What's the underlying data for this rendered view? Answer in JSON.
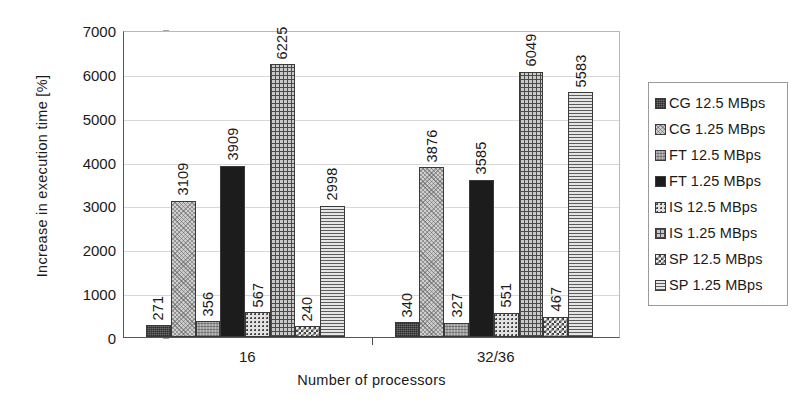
{
  "chart_data": {
    "type": "bar",
    "title": "",
    "subtitle": "",
    "xlabel": "Number of processors",
    "ylabel": "Increase in execution time [%]",
    "categories": [
      "16",
      "32/36"
    ],
    "ylim": [
      0,
      7000
    ],
    "yticks": [
      0,
      1000,
      2000,
      3000,
      4000,
      5000,
      6000,
      7000
    ],
    "ytick_labels": [
      "0",
      "1000",
      "2000",
      "3000",
      "4000",
      "5000",
      "6000",
      "7000"
    ],
    "grid": true,
    "legend_position": "right",
    "series": [
      {
        "name": "CG 12.5 MBps",
        "pattern": "dark-grey-noise",
        "values": [
          271,
          340
        ]
      },
      {
        "name": "CG 1.25 MBps",
        "pattern": "light-stipple",
        "values": [
          3109,
          3876
        ]
      },
      {
        "name": "FT 12.5 MBps",
        "pattern": "mid-grey-texture",
        "values": [
          356,
          327
        ]
      },
      {
        "name": "FT 1.25 MBps",
        "pattern": "solid-black",
        "values": [
          3909,
          3585
        ]
      },
      {
        "name": "IS 12.5 MBps",
        "pattern": "dotted",
        "values": [
          567,
          551
        ]
      },
      {
        "name": "IS 1.25 MBps",
        "pattern": "cross-hatch",
        "values": [
          6225,
          6049
        ]
      },
      {
        "name": "SP 12.5 MBps",
        "pattern": "checkerboard",
        "values": [
          240,
          467
        ]
      },
      {
        "name": "SP 1.25 MBps",
        "pattern": "horizontal-lines",
        "values": [
          2998,
          5583
        ]
      }
    ],
    "data_labels": [
      [
        "271",
        "3109",
        "356",
        "3909",
        "567",
        "6225",
        "240",
        "2998"
      ],
      [
        "340",
        "3876",
        "327",
        "3585",
        "551",
        "6049",
        "467",
        "5583"
      ]
    ]
  },
  "legend": {
    "items": [
      {
        "label": "CG 12.5 MBps"
      },
      {
        "label": "CG 1.25 MBps"
      },
      {
        "label": "FT 12.5 MBps"
      },
      {
        "label": "FT 1.25 MBps"
      },
      {
        "label": "IS 12.5 MBps"
      },
      {
        "label": "IS 1.25 MBps"
      },
      {
        "label": "SP 12.5 MBps"
      },
      {
        "label": "SP 1.25 MBps"
      }
    ]
  },
  "colors": {
    "axis": "#555555",
    "grid": "#d8d8d8",
    "text": "#1a1a1a",
    "background": "#ffffff"
  }
}
